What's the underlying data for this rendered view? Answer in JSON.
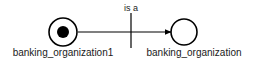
{
  "diagram": {
    "type": "node-link-graph",
    "background_color": "#ffffff",
    "stroke_color": "#000000",
    "text_color": "#1a1a1a",
    "nodes": [
      {
        "id": "instance-node",
        "label": "banking_organization1",
        "shape": "circle-with-filled-dot",
        "cx": 63,
        "cy": 32,
        "r": 14,
        "inner_r": 6,
        "filled": true,
        "label_x": 63,
        "label_y": 56
      },
      {
        "id": "class-node",
        "label": "banking_organization",
        "shape": "circle",
        "cx": 184,
        "cy": 32,
        "r": 13,
        "inner_r": 0,
        "filled": false,
        "label_x": 194,
        "label_y": 56
      }
    ],
    "edges": [
      {
        "id": "is-a-edge",
        "label": "is a",
        "from": "instance-node",
        "to": "class-node",
        "x1": 78,
        "x2": 171,
        "y": 32,
        "arrowhead": "filled-triangle",
        "label_x": 131,
        "label_y": 10
      }
    ],
    "tick": {
      "id": "edge-tick",
      "x": 131,
      "y1": 13,
      "y2": 48
    }
  }
}
